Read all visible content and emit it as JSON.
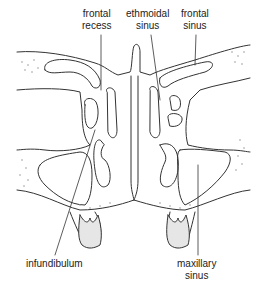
{
  "diagram": {
    "type": "anatomical cross-section",
    "colors": {
      "line": "#333333",
      "bone_dots": "#999999",
      "tooth_fill": "#e6e6e6",
      "background": "#ffffff"
    }
  },
  "labels": {
    "frontal_recess": {
      "line1": "frontal",
      "line2": "recess"
    },
    "ethmoidal_sinus": {
      "line1": "ethmoidal",
      "line2": "sinus"
    },
    "frontal_sinus": {
      "line1": "frontal",
      "line2": "sinus"
    },
    "infundibulum": {
      "line1": "infundibulum"
    },
    "maxillary_sinus": {
      "line1": "maxillary",
      "line2": "sinus"
    }
  }
}
